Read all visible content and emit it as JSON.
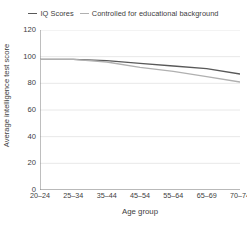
{
  "chart_data": {
    "type": "line",
    "title": "",
    "xlabel": "Age group",
    "ylabel": "Average intelligence test score",
    "categories": [
      "20–24",
      "25–34",
      "35–44",
      "45–54",
      "55–64",
      "65–69",
      "70–74"
    ],
    "series": [
      {
        "name": "IQ Scores",
        "color": "#595959",
        "values": [
          98,
          98,
          97,
          95,
          93,
          91,
          87
        ]
      },
      {
        "name": "Controlled for educational background",
        "color": "#b0b0b0",
        "values": [
          98,
          98,
          96,
          92,
          89,
          85,
          81
        ]
      }
    ],
    "ylim": [
      0,
      120
    ],
    "yticks": [
      0,
      20,
      40,
      60,
      80,
      100,
      120
    ],
    "ytick_labels": [
      "0",
      "20",
      "40",
      "60",
      "80",
      "100",
      "120"
    ],
    "grid": "horizontal",
    "grid_color": "#e8e8e8",
    "axis_color": "#7f7f7f",
    "legend_position": "top-center",
    "background": "#ffffff"
  },
  "legend": {
    "entries": [
      {
        "label": "IQ Scores"
      },
      {
        "label": "Controlled for educational background"
      }
    ]
  }
}
